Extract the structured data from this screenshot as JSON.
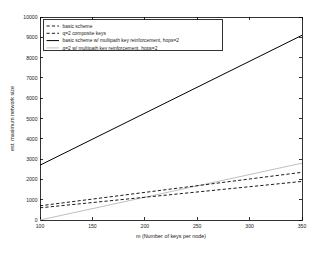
{
  "chart_data": {
    "type": "line",
    "title": "",
    "xlabel": "m (Number of keys per node)",
    "ylabel": "est. maximum network size",
    "xlim": [
      100,
      350
    ],
    "ylim": [
      0,
      10000
    ],
    "xticks": [
      100,
      150,
      200,
      250,
      300,
      350
    ],
    "yticks": [
      0,
      1000,
      2000,
      3000,
      4000,
      5000,
      6000,
      7000,
      8000,
      9000,
      10000
    ],
    "xtick_labels": [
      "100",
      "150",
      "200",
      "250",
      "300",
      "350"
    ],
    "ytick_labels": [
      "0",
      "1000",
      "2000",
      "3000",
      "4000",
      "5000",
      "6000",
      "7000",
      "8000",
      "9000",
      "10000"
    ],
    "grid": false,
    "legend_position": "upper left",
    "x": [
      100,
      350
    ],
    "series": [
      {
        "name": "basic scheme",
        "style": "dashed",
        "color": "#000000",
        "values": [
          600,
          1900
        ]
      },
      {
        "name": "q=2 composite keys",
        "style": "dashed",
        "color": "#000000",
        "values": [
          700,
          2350
        ]
      },
      {
        "name": "basic scheme w/ multipath key reinforcement, hops=2",
        "style": "solid",
        "color": "#000000",
        "values": [
          2700,
          9100
        ]
      },
      {
        "name": "q=2 w/ multipath key reinforcement, hops=2",
        "style": "solid",
        "color": "#b8b8b8",
        "values": [
          0,
          2800
        ]
      }
    ]
  },
  "legend": {
    "entries": [
      {
        "label": "basic scheme"
      },
      {
        "label": "q=2 composite keys"
      },
      {
        "label": "basic scheme w/ multipath key reinforcement, hops=2"
      },
      {
        "label": "q=2 w/ multipath key reinforcement, hops=2"
      }
    ]
  }
}
